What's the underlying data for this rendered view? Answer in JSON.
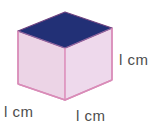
{
  "figure": {
    "name": "cube-with-dimension-labels",
    "background_color": "#ffffff"
  },
  "cube": {
    "top_face_color": "#223076",
    "left_face_color": "#ecd4e6",
    "right_face_color": "#eed9ec",
    "edge_color": "#d98cb8",
    "inner_edge_color": "#e7a5c8",
    "top_edge_color": "#7a4d87",
    "vertices": {
      "top_apex": [
        65,
        12
      ],
      "top_left": [
        18,
        31
      ],
      "top_right": [
        112,
        28
      ],
      "top_center": [
        65,
        48
      ],
      "bottom_left": [
        18,
        84
      ],
      "bottom_right": [
        112,
        80
      ],
      "bottom_center": [
        65,
        100
      ]
    }
  },
  "labels": {
    "right": "l cm",
    "left": "l cm",
    "front": "l cm",
    "text_color": "#4d4d4d"
  }
}
